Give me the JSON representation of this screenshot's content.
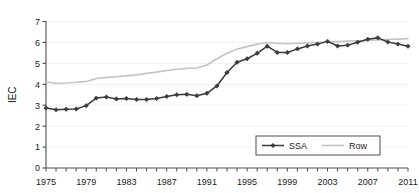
{
  "chart_data": {
    "type": "line",
    "title": "",
    "xlabel": "",
    "ylabel": "IEC",
    "xlim": [
      1975,
      2011
    ],
    "ylim": [
      0,
      7
    ],
    "ytick_step": 1,
    "yticks": [
      "0",
      "1",
      "2",
      "3",
      "4",
      "5",
      "6",
      "7"
    ],
    "xtick_labels": [
      "1975",
      "1979",
      "1983",
      "1987",
      "1991",
      "1995",
      "1999",
      "2003",
      "2007",
      "2011"
    ],
    "xtick_label_step": 4,
    "xtick_minor_step": 1,
    "grid": "horizontal-light",
    "legend_position": "bottom-right",
    "x": [
      1975,
      1976,
      1977,
      1978,
      1979,
      1980,
      1981,
      1982,
      1983,
      1984,
      1985,
      1986,
      1987,
      1988,
      1989,
      1990,
      1991,
      1992,
      1993,
      1994,
      1995,
      1996,
      1997,
      1998,
      1999,
      2000,
      2001,
      2002,
      2003,
      2004,
      2005,
      2006,
      2007,
      2008,
      2009,
      2010,
      2011
    ],
    "series": [
      {
        "name": "SSA",
        "color": "#3b3b3b",
        "marker": "diamond",
        "values": [
          2.87,
          2.78,
          2.81,
          2.82,
          2.98,
          3.34,
          3.39,
          3.3,
          3.32,
          3.27,
          3.27,
          3.32,
          3.42,
          3.5,
          3.52,
          3.45,
          3.57,
          3.92,
          4.56,
          5.05,
          5.22,
          5.48,
          5.82,
          5.52,
          5.52,
          5.69,
          5.83,
          5.92,
          6.05,
          5.83,
          5.87,
          6.01,
          6.15,
          6.22,
          6.02,
          5.92,
          5.82
        ]
      },
      {
        "name": "Row",
        "color": "#c4c4c4",
        "marker": "none",
        "values": [
          4.12,
          4.04,
          4.06,
          4.1,
          4.13,
          4.28,
          4.33,
          4.36,
          4.4,
          4.45,
          4.52,
          4.58,
          4.66,
          4.72,
          4.76,
          4.78,
          4.92,
          5.22,
          5.48,
          5.68,
          5.8,
          5.92,
          6.0,
          5.96,
          5.94,
          5.96,
          5.98,
          6.0,
          6.02,
          6.04,
          6.06,
          6.08,
          6.1,
          6.12,
          6.14,
          6.16,
          6.18
        ]
      }
    ]
  },
  "legend": {
    "items": [
      {
        "label": "SSA"
      },
      {
        "label": "Row"
      }
    ]
  },
  "axis": {
    "y_title": "IEC"
  },
  "colors": {
    "ssa": "#3b3b3b",
    "row": "#c4c4c4",
    "axis": "#4d4d4d",
    "grid": "#ececec",
    "text": "#1a1a1a"
  }
}
